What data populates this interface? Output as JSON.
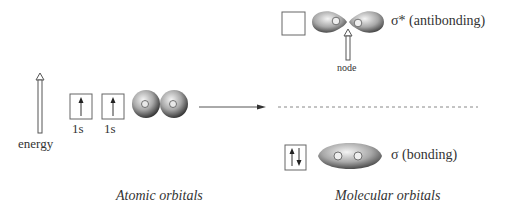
{
  "energy_label": "energy",
  "atomic": {
    "orbital_labels": [
      "1s",
      "1s"
    ],
    "section_title": "Atomic orbitals"
  },
  "molecular": {
    "antibonding_label": "σ* (antibonding)",
    "node_label": "node",
    "bonding_label": "σ (bonding)",
    "section_title": "Molecular orbitals"
  },
  "colors": {
    "line": "#555555",
    "orbital_dark": "#444444",
    "orbital_light": "#f0f0f0"
  }
}
